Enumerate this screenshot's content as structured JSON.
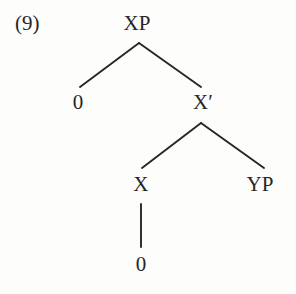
{
  "figure": {
    "example_number": "(9)",
    "type": "syntax-tree",
    "background_color": "#fdfdfb",
    "ink_color": "#262626"
  },
  "tree": {
    "nodes": [
      {
        "id": "xp",
        "label": "XP",
        "x": 137,
        "y": 23,
        "role": "root-phrase"
      },
      {
        "id": "spec",
        "label": "0",
        "x": 78,
        "y": 102,
        "role": "specifier"
      },
      {
        "id": "xbar",
        "label": "X′",
        "x": 203,
        "y": 102,
        "role": "intermediate-bar"
      },
      {
        "id": "head",
        "label": "X",
        "x": 141,
        "y": 184,
        "role": "head"
      },
      {
        "id": "yp",
        "label": "YP",
        "x": 260,
        "y": 184,
        "role": "complement"
      },
      {
        "id": "headdtr",
        "label": "0",
        "x": 141,
        "y": 264,
        "role": "head-terminal"
      }
    ],
    "edges": [
      {
        "from": "xp",
        "to": "spec",
        "x1": 139,
        "y1": 43,
        "x2": 80,
        "y2": 87
      },
      {
        "from": "xp",
        "to": "xbar",
        "x1": 139,
        "y1": 43,
        "x2": 201,
        "y2": 87
      },
      {
        "from": "xbar",
        "to": "head",
        "x1": 201,
        "y1": 123,
        "x2": 142,
        "y2": 168
      },
      {
        "from": "xbar",
        "to": "yp",
        "x1": 201,
        "y1": 123,
        "x2": 264,
        "y2": 168
      },
      {
        "from": "head",
        "to": "headdtr",
        "x1": 141,
        "y1": 204,
        "x2": 141,
        "y2": 247
      }
    ],
    "stroke_width": 1.9
  }
}
